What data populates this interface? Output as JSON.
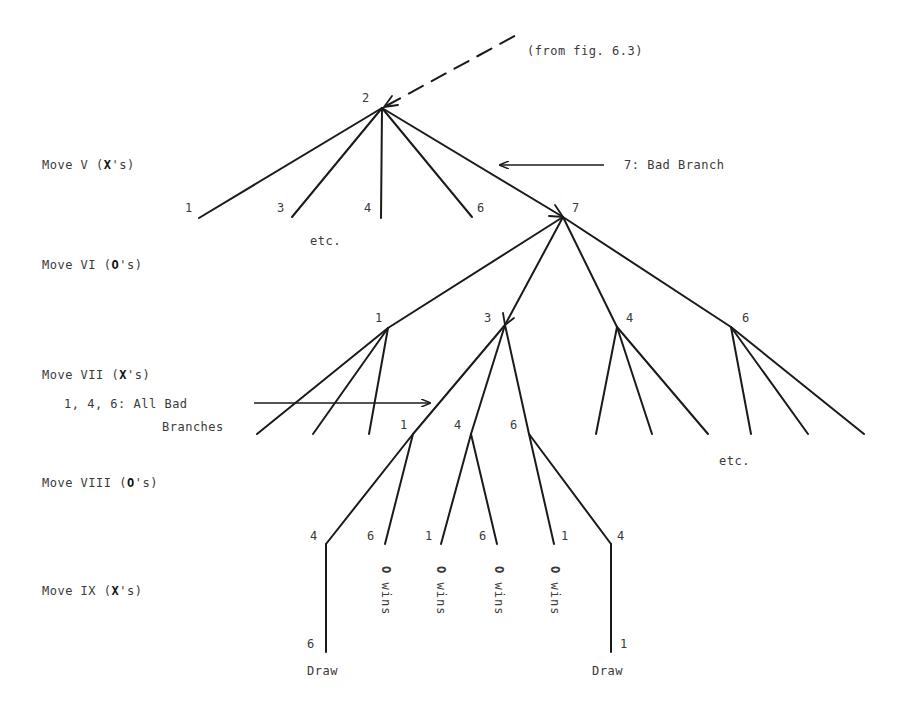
{
  "source_note": "(from fig. 6.3)",
  "annotations": {
    "bad_branch_7": "7:  Bad Branch",
    "bad_branches_146_line1": "1, 4, 6:  All Bad",
    "bad_branches_146_line2": "Branches",
    "etc_1": "etc.",
    "etc_2": "etc."
  },
  "rows": [
    {
      "prefix": "Move V (",
      "player": "X",
      "suffix": "'s)"
    },
    {
      "prefix": "Move VI (",
      "player": "O",
      "suffix": "'s)"
    },
    {
      "prefix": "Move VII (",
      "player": "X",
      "suffix": "'s)"
    },
    {
      "prefix": "Move VIII (",
      "player": "O",
      "suffix": "'s)"
    },
    {
      "prefix": "Move IX (",
      "player": "X",
      "suffix": "'s)"
    }
  ],
  "nodes": {
    "root": "2",
    "v": [
      "1",
      "3",
      "4",
      "6",
      "7"
    ],
    "vi": [
      "1",
      "3",
      "4",
      "6"
    ],
    "vii": [
      "1",
      "4",
      "6"
    ],
    "viii": [
      "4",
      "6",
      "1",
      "6",
      "1",
      "4"
    ],
    "ix": [
      "6",
      "1"
    ]
  },
  "outcomes": {
    "o_wins": "O",
    "wins": "wins",
    "draw": "Draw"
  },
  "colors": {
    "line": "#1a1a1a",
    "text": "#3a3a3a",
    "background": "#ffffff"
  }
}
